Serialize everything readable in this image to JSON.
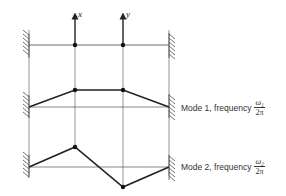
{
  "diagram": {
    "coordinates": {
      "x_label": "x",
      "y_label": "y"
    },
    "modes": [
      {
        "label": "Mode 1, frequency",
        "freq_num": "ω₁",
        "freq_den": "2π",
        "shape": "in-phase"
      },
      {
        "label": "Mode 2, frequency",
        "freq_num": "ω₂",
        "freq_den": "2π",
        "shape": "out-of-phase"
      }
    ]
  }
}
